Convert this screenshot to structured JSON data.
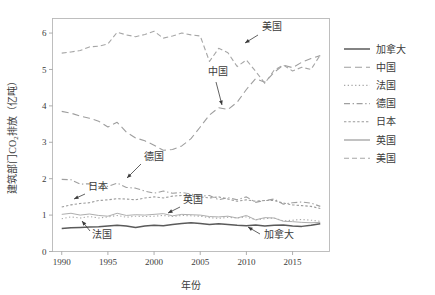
{
  "chart_data": {
    "type": "line",
    "title": "",
    "xlabel": "年份",
    "ylabel": "建筑部门CO₂排放（亿吨）",
    "xlim": [
      1989,
      2019
    ],
    "ylim": [
      0,
      6.4
    ],
    "xticks": [
      1990,
      1995,
      2000,
      2005,
      2010,
      2015
    ],
    "xticklabels": [
      "1990",
      "1995",
      "2000",
      "2005",
      "2010",
      "2015"
    ],
    "yticks": [
      0,
      1,
      2,
      3,
      4,
      5,
      6
    ],
    "yticklabels": [
      "0",
      "1",
      "2",
      "3",
      "4",
      "5",
      "6"
    ],
    "grid": false,
    "legend_position": "right",
    "x": [
      1990,
      1991,
      1992,
      1993,
      1994,
      1995,
      1996,
      1997,
      1998,
      1999,
      2000,
      2001,
      2002,
      2003,
      2004,
      2005,
      2006,
      2007,
      2008,
      2009,
      2010,
      2011,
      2012,
      2013,
      2014,
      2015,
      2016,
      2017,
      2018
    ],
    "series": [
      {
        "name": "加拿大",
        "color": "#5a5a5a",
        "dash": "none",
        "width": 1.5,
        "values": [
          0.63,
          0.65,
          0.66,
          0.67,
          0.68,
          0.7,
          0.72,
          0.7,
          0.66,
          0.7,
          0.72,
          0.71,
          0.74,
          0.77,
          0.79,
          0.77,
          0.74,
          0.76,
          0.74,
          0.72,
          0.71,
          0.73,
          0.7,
          0.72,
          0.73,
          0.7,
          0.69,
          0.72,
          0.76
        ]
      },
      {
        "name": "中国",
        "color": "#9e9e9e",
        "dash": "long",
        "width": 1.1,
        "values": [
          3.85,
          3.8,
          3.72,
          3.66,
          3.58,
          3.42,
          3.55,
          3.28,
          3.12,
          3.04,
          2.92,
          2.78,
          2.8,
          2.9,
          3.1,
          3.42,
          3.75,
          3.95,
          3.9,
          4.1,
          4.45,
          4.75,
          4.65,
          4.92,
          5.12,
          5.05,
          5.2,
          5.3,
          5.38
        ]
      },
      {
        "name": "法国",
        "color": "#a8a8a8",
        "dash": "dotted",
        "width": 1.1,
        "values": [
          0.9,
          0.95,
          0.92,
          0.96,
          0.92,
          0.95,
          0.99,
          0.94,
          0.97,
          0.96,
          0.97,
          0.99,
          0.96,
          0.99,
          0.98,
          0.97,
          0.93,
          0.91,
          0.94,
          0.92,
          0.95,
          0.87,
          0.9,
          0.92,
          0.84,
          0.86,
          0.88,
          0.86,
          0.83
        ]
      },
      {
        "name": "德国",
        "color": "#a0a0a0",
        "dash": "dashdot",
        "width": 1.1,
        "values": [
          1.98,
          1.97,
          1.85,
          1.86,
          1.78,
          1.79,
          1.88,
          1.76,
          1.74,
          1.66,
          1.6,
          1.66,
          1.6,
          1.62,
          1.58,
          1.52,
          1.54,
          1.42,
          1.48,
          1.42,
          1.5,
          1.35,
          1.4,
          1.44,
          1.3,
          1.34,
          1.36,
          1.33,
          1.24
        ]
      },
      {
        "name": "日本",
        "color": "#9b9b9b",
        "dash": "fine",
        "width": 1.1,
        "values": [
          1.22,
          1.28,
          1.32,
          1.34,
          1.4,
          1.42,
          1.45,
          1.44,
          1.42,
          1.47,
          1.5,
          1.47,
          1.52,
          1.54,
          1.52,
          1.5,
          1.47,
          1.5,
          1.44,
          1.38,
          1.42,
          1.38,
          1.4,
          1.4,
          1.33,
          1.28,
          1.26,
          1.24,
          1.18
        ]
      },
      {
        "name": "英国",
        "color": "#aeaeae",
        "dash": "none",
        "width": 1.0,
        "values": [
          1.02,
          1.05,
          1.0,
          1.03,
          0.99,
          0.97,
          1.05,
          0.99,
          1.01,
          1.0,
          1.02,
          1.04,
          0.98,
          1.02,
          1.01,
          1.0,
          0.96,
          0.95,
          0.97,
          0.92,
          0.99,
          0.87,
          0.93,
          0.92,
          0.83,
          0.82,
          0.8,
          0.79,
          0.8
        ]
      },
      {
        "name": "美国",
        "color": "#a6a6a6",
        "dash": "medium",
        "width": 1.1,
        "values": [
          5.45,
          5.48,
          5.52,
          5.62,
          5.64,
          5.7,
          6.02,
          5.95,
          5.9,
          5.96,
          6.05,
          5.86,
          5.92,
          6.0,
          5.95,
          5.92,
          5.22,
          5.58,
          5.46,
          5.08,
          5.26,
          4.95,
          4.62,
          4.98,
          5.12,
          4.96,
          5.06,
          5.0,
          5.4
        ]
      }
    ],
    "annotations": [
      {
        "label": "美国",
        "x_px": 262,
        "y_px": 30,
        "arrow_from_x": 258,
        "arrow_from_y": 35,
        "arrow_to_x": 245,
        "arrow_to_y": 43
      },
      {
        "label": "中国",
        "x_px": 208,
        "y_px": 75,
        "arrow_from_x": 216,
        "arrow_from_y": 82,
        "arrow_to_x": 222,
        "arrow_to_y": 105
      },
      {
        "label": "德国",
        "x_px": 144,
        "y_px": 160,
        "arrow_from_x": 141,
        "arrow_from_y": 164,
        "arrow_to_x": 127,
        "arrow_to_y": 178
      },
      {
        "label": "日本",
        "x_px": 88,
        "y_px": 190,
        "arrow_from_x": 85,
        "arrow_from_y": 194,
        "arrow_to_x": 74,
        "arrow_to_y": 199
      },
      {
        "label": "英国",
        "x_px": 183,
        "y_px": 203,
        "arrow_from_x": 180,
        "arrow_from_y": 207,
        "arrow_to_x": 168,
        "arrow_to_y": 213
      },
      {
        "label": "法国",
        "x_px": 92,
        "y_px": 238,
        "arrow_from_x": 90,
        "arrow_from_y": 231,
        "arrow_to_x": 82,
        "arrow_to_y": 221
      },
      {
        "label": "加拿大",
        "x_px": 264,
        "y_px": 238,
        "arrow_from_x": 260,
        "arrow_from_y": 234,
        "arrow_to_x": 248,
        "arrow_to_y": 227
      }
    ]
  },
  "legend": {
    "items": [
      {
        "label": "加拿大",
        "color": "#5a5a5a",
        "dash": "none"
      },
      {
        "label": "中国",
        "color": "#9e9e9e",
        "dash": "long"
      },
      {
        "label": "法国",
        "color": "#a8a8a8",
        "dash": "dotted"
      },
      {
        "label": "德国",
        "color": "#a0a0a0",
        "dash": "dashdot"
      },
      {
        "label": "日本",
        "color": "#9b9b9b",
        "dash": "fine"
      },
      {
        "label": "英国",
        "color": "#aeaeae",
        "dash": "none"
      },
      {
        "label": "美国",
        "color": "#a6a6a6",
        "dash": "medium"
      }
    ]
  }
}
